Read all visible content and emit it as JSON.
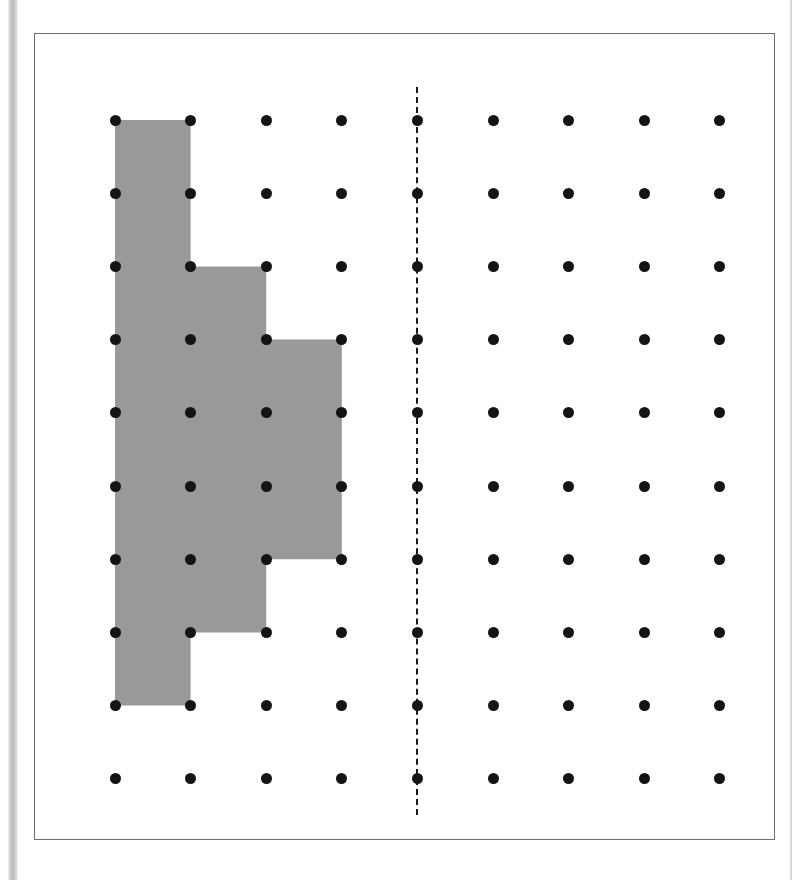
{
  "page": {
    "width": 804,
    "height": 880,
    "background_color": "#ffffff",
    "left_edge_bar_color": "#c9c9c9",
    "right_edge_rule_color": "#d8d8d8"
  },
  "frame": {
    "name": "figure-frame",
    "x": 34,
    "y": 33,
    "width": 741,
    "height": 807,
    "border_color": "#6e6e6e",
    "border_width": 1,
    "fill_color": "#ffffff"
  },
  "chart_data": {
    "type": "scatter",
    "title": "",
    "subtitle": "",
    "xlabel": "",
    "ylabel": "",
    "grid": false,
    "legend_position": "none",
    "lattice": {
      "columns": 9,
      "rows": 10,
      "origin_x": 80,
      "origin_y": 86,
      "spacing_x": 75.6,
      "spacing_y": 73.2,
      "dot_radius": 5.5,
      "dot_color": "#141414",
      "column_indices": [
        1,
        2,
        3,
        4,
        5,
        6,
        7,
        8,
        9
      ],
      "row_indices": [
        1,
        2,
        3,
        4,
        5,
        6,
        7,
        8,
        9,
        10
      ]
    },
    "mirror_line": {
      "name": "line-of-symmetry",
      "orientation": "vertical",
      "at_column": 5,
      "style": "dashed",
      "color": "#1a1a1a",
      "width": 2,
      "top_row": 0.55,
      "bottom_row": 10.5
    },
    "shaded_polygon": {
      "name": "shaded-staircase-region",
      "fill_color": "#999999",
      "stroke": "none",
      "units": "lattice (column,row) indices, 1-based",
      "vertices": [
        [
          1,
          1
        ],
        [
          2,
          1
        ],
        [
          2,
          3
        ],
        [
          3,
          3
        ],
        [
          3,
          4
        ],
        [
          4,
          4
        ],
        [
          4,
          7
        ],
        [
          3,
          7
        ],
        [
          3,
          8
        ],
        [
          2,
          8
        ],
        [
          2,
          9
        ],
        [
          1,
          9
        ]
      ],
      "cell_runs": [
        {
          "rows": "1-3",
          "columns": "1-2"
        },
        {
          "rows": "3-4",
          "columns": "1-3"
        },
        {
          "rows": "4-7",
          "columns": "1-4"
        },
        {
          "rows": "7-8",
          "columns": "1-3"
        },
        {
          "rows": "8-9",
          "columns": "1-2"
        }
      ],
      "area_unit_squares": 13
    }
  }
}
